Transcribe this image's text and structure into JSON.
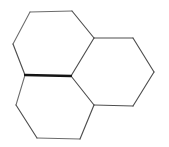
{
  "figure": {
    "background_color": "#ffffff",
    "width": 169,
    "height": 147
  },
  "style": {
    "bond_color": "#4f4f4f",
    "bond_color_light": "#6b6b6b",
    "bond_color_bold": "#141414",
    "bond_width": 1.15,
    "bond_width_light": 1.05,
    "bond_width_bold": 2.3,
    "face_fill": "#ffffff"
  },
  "vertices": {
    "center_junction": [
      71,
      76
    ],
    "left_junction": [
      25,
      75
    ],
    "lower_right_junction": [
      94,
      105
    ],
    "upper_right_junction": [
      94,
      38
    ],
    "top_ring_top_left": [
      30,
      12
    ],
    "top_ring_top_right": [
      72,
      11
    ],
    "top_ring_left": [
      13,
      44
    ],
    "right_ring_top_right": [
      133,
      38
    ],
    "right_ring_right": [
      154,
      72
    ],
    "right_ring_bottom_right": [
      133,
      106
    ],
    "bottom_ring_left": [
      16,
      105
    ],
    "bottom_ring_bottom_left": [
      37,
      138
    ],
    "bottom_ring_bottom_right": [
      80,
      139
    ]
  },
  "rings": [
    {
      "name": "top-left-ring",
      "label": "Top left hexagon",
      "points": "30,12 72,11 94,38 71,76 25,75 13,44"
    },
    {
      "name": "right-ring",
      "label": "Right hexagon",
      "points": "94,38 133,38 154,72 133,106 94,105 71,76"
    },
    {
      "name": "bottom-left-ring",
      "label": "Bottom left hexagon",
      "points": "71,76 94,105 80,139 37,138 16,105 25,75"
    }
  ],
  "bonds": [
    {
      "name": "bond-top-ring-top",
      "d": "M30,12 L72,11",
      "weight": "light"
    },
    {
      "name": "bond-top-ring-upper-right",
      "d": "M72,11 L94,38",
      "weight": "normal"
    },
    {
      "name": "bond-top-ring-upper-left",
      "d": "M30,12 L13,44",
      "weight": "light"
    },
    {
      "name": "bond-top-ring-lower-left",
      "d": "M13,44 L25,75",
      "weight": "normal"
    },
    {
      "name": "bond-shared-top-right",
      "d": "M94,38 L71,76",
      "weight": "normal"
    },
    {
      "name": "bond-shared-center-left",
      "d": "M25,75 L71,76",
      "weight": "bold"
    },
    {
      "name": "bond-right-ring-top",
      "d": "M94,38 L133,38",
      "weight": "normal"
    },
    {
      "name": "bond-right-ring-upper-right",
      "d": "M133,38 L154,72",
      "weight": "normal"
    },
    {
      "name": "bond-right-ring-lower-right",
      "d": "M154,72 L133,106",
      "weight": "normal"
    },
    {
      "name": "bond-right-ring-bottom",
      "d": "M133,106 L94,105",
      "weight": "normal"
    },
    {
      "name": "bond-shared-center-lower",
      "d": "M71,76 L94,105",
      "weight": "normal"
    },
    {
      "name": "bond-bottom-ring-left-upper",
      "d": "M25,75 L16,105",
      "weight": "light"
    },
    {
      "name": "bond-bottom-ring-left-lower",
      "d": "M16,105 L37,138",
      "weight": "normal"
    },
    {
      "name": "bond-bottom-ring-bottom",
      "d": "M37,138 L80,139",
      "weight": "light"
    },
    {
      "name": "bond-bottom-ring-right",
      "d": "M80,139 L94,105",
      "weight": "normal"
    }
  ]
}
